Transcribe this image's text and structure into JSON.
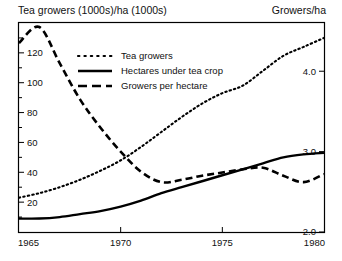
{
  "header": {
    "left_label": "Tea growers (1000s)/ha (1000s)",
    "right_label": "Growers/ha"
  },
  "chart_data": {
    "type": "line",
    "title": "Tea growers (1000s)/ha (1000s)",
    "xlabel": "",
    "ylabel": "Tea growers (1000s)/ha (1000s)",
    "y2label": "Growers/ha",
    "xlim": [
      1965,
      1980
    ],
    "ylim": [
      0,
      140
    ],
    "y2lim": [
      2.0,
      4.6
    ],
    "grid": false,
    "legend_position": "upper-left-inside",
    "xticks": [
      1965,
      1970,
      1975,
      1980
    ],
    "xticklabels": [
      "1965",
      "1970",
      "1975",
      "1980"
    ],
    "yticks": [
      20,
      40,
      60,
      80,
      100,
      120
    ],
    "yticklabels": [
      "20",
      "40",
      "60",
      "80",
      "100",
      "120"
    ],
    "y2ticks": [
      2.0,
      3.0,
      4.0
    ],
    "y2ticklabels": [
      "2.0",
      "3.0",
      "4.0"
    ],
    "series": [
      {
        "name": "Tea growers",
        "style": "dotted",
        "axis": "left",
        "x": [
          1965,
          1966,
          1967,
          1968,
          1969,
          1970,
          1971,
          1972,
          1973,
          1974,
          1975,
          1976,
          1977,
          1978,
          1979,
          1980
        ],
        "values": [
          23,
          26,
          30,
          35,
          41,
          48,
          57,
          67,
          77,
          86,
          93,
          98,
          108,
          118,
          124,
          130
        ]
      },
      {
        "name": "Hectares under tea crop",
        "style": "solid",
        "axis": "left",
        "x": [
          1965,
          1966,
          1967,
          1968,
          1969,
          1970,
          1971,
          1972,
          1973,
          1974,
          1975,
          1976,
          1977,
          1978,
          1979,
          1980
        ],
        "values": [
          9,
          9,
          10,
          12,
          14,
          17,
          21,
          26,
          30,
          34,
          38,
          42,
          46,
          50,
          52,
          53
        ]
      },
      {
        "name": "Growers per hectare",
        "style": "dashed",
        "axis": "right",
        "x": [
          1965,
          1966,
          1967,
          1968,
          1969,
          1970,
          1971,
          1972,
          1973,
          1974,
          1975,
          1976,
          1977,
          1978,
          1979,
          1980
        ],
        "values": [
          4.35,
          4.55,
          4.1,
          3.65,
          3.3,
          3.0,
          2.75,
          2.62,
          2.65,
          2.7,
          2.74,
          2.78,
          2.8,
          2.7,
          2.62,
          2.72
        ]
      }
    ],
    "legend": [
      {
        "label": "Tea growers",
        "style": "dotted"
      },
      {
        "label": "Hectares under tea crop",
        "style": "solid"
      },
      {
        "label": "Growers per hectare",
        "style": "dashed"
      }
    ]
  }
}
